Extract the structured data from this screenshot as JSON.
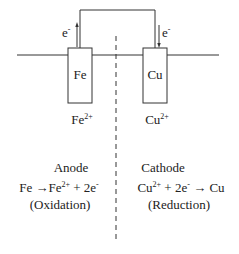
{
  "diagram": {
    "electron_left": {
      "base": "e",
      "sup": "-"
    },
    "electron_right": {
      "base": "e",
      "sup": "-"
    },
    "anode_electrode": {
      "label": "Fe"
    },
    "cathode_electrode": {
      "label": "Cu"
    },
    "anode_ion": {
      "base": "Fe",
      "sup": "2+"
    },
    "cathode_ion": {
      "base": "Cu",
      "sup": "2+"
    },
    "anode": {
      "heading": "Anode",
      "reaction": {
        "lhs": "Fe",
        "arrow": "→",
        "ion_base": "Fe",
        "ion_sup": "2+",
        "plus": "+",
        "electrons": "2e",
        "electron_sup": "-"
      },
      "process": "(Oxidation)"
    },
    "cathode": {
      "heading": "Cathode",
      "reaction": {
        "ion_base": "Cu",
        "ion_sup": "2+",
        "plus": "+",
        "electrons": "2e",
        "electron_sup": "-",
        "arrow": "→",
        "rhs": "Cu"
      },
      "process": "(Reduction)"
    },
    "colors": {
      "line": "#333333",
      "background": "#ffffff"
    }
  }
}
